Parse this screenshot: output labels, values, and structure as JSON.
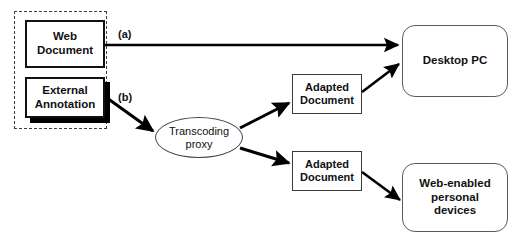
{
  "diagram": {
    "background_color": "#ffffff",
    "line_color": "#000000",
    "group": {
      "name": "source-group",
      "style": "dashed"
    },
    "nodes": [
      {
        "id": "web-document",
        "label": "Web\nDocument",
        "line1": "Web",
        "line2": "Document",
        "shape": "rectangle"
      },
      {
        "id": "external-annotation",
        "label": "External\nAnnotation",
        "line1": "External",
        "line2": "Annotation",
        "shape": "rectangle-shadow"
      },
      {
        "id": "transcoding-proxy",
        "label": "Transcoding\nproxy",
        "line1": "Transcoding",
        "line2": "proxy",
        "shape": "ellipse"
      },
      {
        "id": "adapted-document-1",
        "label": "Adapted\nDocument",
        "line1": "Adapted",
        "line2": "Document",
        "shape": "rectangle"
      },
      {
        "id": "adapted-document-2",
        "label": "Adapted\nDocument",
        "line1": "Adapted",
        "line2": "Document",
        "shape": "rectangle"
      },
      {
        "id": "desktop-pc",
        "label": "Desktop PC",
        "line1": "Desktop PC",
        "shape": "rounded-rectangle"
      },
      {
        "id": "web-enabled-devices",
        "label": "Web-enabled\npersonal\ndevices",
        "line1": "Web-enabled",
        "line2": "personal",
        "line3": "devices",
        "shape": "rounded-rectangle"
      }
    ],
    "edges": [
      {
        "id": "edge-a",
        "label": "(a)",
        "from": "web-document",
        "to": "desktop-pc"
      },
      {
        "id": "edge-b",
        "label": "(b)",
        "from": "external-annotation",
        "to": "transcoding-proxy"
      },
      {
        "id": "edge-proxy-adapted-1",
        "label": "",
        "from": "transcoding-proxy",
        "to": "adapted-document-1"
      },
      {
        "id": "edge-proxy-adapted-2",
        "label": "",
        "from": "transcoding-proxy",
        "to": "adapted-document-2"
      },
      {
        "id": "edge-adapted-1-desktop",
        "label": "",
        "from": "adapted-document-1",
        "to": "desktop-pc"
      },
      {
        "id": "edge-adapted-2-devices",
        "label": "",
        "from": "adapted-document-2",
        "to": "web-enabled-devices"
      }
    ]
  }
}
